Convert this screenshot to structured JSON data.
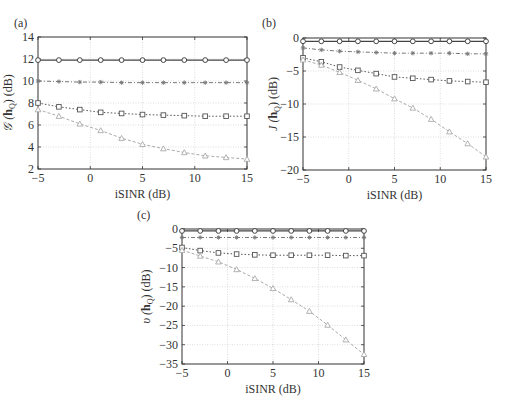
{
  "chart_data": [
    {
      "panel": "(a)",
      "type": "line",
      "title": "",
      "xlabel": "iSINR (dB)",
      "ylabel": "G(h_Q) (dB)",
      "ylabel_parts": {
        "func": "𝒢",
        "arg": "h",
        "sub": "Q",
        "unit": " (dB)"
      },
      "xlim": [
        -5,
        15
      ],
      "ylim": [
        2,
        14
      ],
      "xticks": [
        -5,
        0,
        5,
        10,
        15
      ],
      "yticks": [
        2,
        4,
        6,
        8,
        10,
        12,
        14
      ],
      "grid": true,
      "legend": null,
      "x": [
        -5,
        -3,
        -1,
        1,
        3,
        5,
        7,
        9,
        11,
        13,
        15
      ],
      "series": [
        {
          "name": "circle",
          "marker": "circle",
          "line": "solid",
          "color": "#444444",
          "values": [
            11.9,
            11.9,
            11.9,
            11.9,
            11.9,
            11.9,
            11.9,
            11.9,
            11.9,
            11.9,
            11.9
          ]
        },
        {
          "name": "star",
          "marker": "star",
          "line": "dashdot",
          "color": "#777777",
          "values": [
            10.0,
            9.95,
            9.9,
            9.9,
            9.85,
            9.85,
            9.85,
            9.85,
            9.85,
            9.85,
            9.85
          ]
        },
        {
          "name": "square",
          "marker": "square",
          "line": "dotted",
          "color": "#555555",
          "values": [
            8.0,
            7.65,
            7.4,
            7.15,
            7.05,
            6.95,
            6.9,
            6.85,
            6.8,
            6.8,
            6.8
          ]
        },
        {
          "name": "triangle",
          "marker": "triangle",
          "line": "dashed",
          "color": "#aaaaaa",
          "values": [
            7.4,
            6.8,
            6.1,
            5.5,
            4.8,
            4.25,
            3.85,
            3.5,
            3.2,
            3.05,
            2.9
          ]
        }
      ]
    },
    {
      "panel": "(b)",
      "type": "line",
      "title": "",
      "xlabel": "iSINR (dB)",
      "ylabel": "J(h_Q) (dB)",
      "ylabel_parts": {
        "func": "J",
        "arg": "h",
        "sub": "Q",
        "unit": " (dB)"
      },
      "xlim": [
        -5,
        15
      ],
      "ylim": [
        -20,
        0
      ],
      "xticks": [
        -5,
        0,
        5,
        10,
        15
      ],
      "yticks": [
        -20,
        -15,
        -10,
        -5,
        0
      ],
      "grid": true,
      "legend": null,
      "x": [
        -5,
        -3,
        -1,
        1,
        3,
        5,
        7,
        9,
        11,
        13,
        15
      ],
      "series": [
        {
          "name": "circle",
          "marker": "circle",
          "line": "solid",
          "color": "#444444",
          "values": [
            -0.5,
            -0.5,
            -0.5,
            -0.5,
            -0.5,
            -0.5,
            -0.5,
            -0.5,
            -0.5,
            -0.5,
            -0.5
          ]
        },
        {
          "name": "star",
          "marker": "star",
          "line": "dashdot",
          "color": "#777777",
          "values": [
            -1.5,
            -1.8,
            -2.0,
            -2.1,
            -2.2,
            -2.3,
            -2.3,
            -2.3,
            -2.3,
            -2.4,
            -2.4
          ]
        },
        {
          "name": "square",
          "marker": "square",
          "line": "dotted",
          "color": "#555555",
          "values": [
            -3.0,
            -3.6,
            -4.4,
            -4.9,
            -5.4,
            -5.9,
            -6.1,
            -6.3,
            -6.5,
            -6.6,
            -6.7
          ]
        },
        {
          "name": "triangle",
          "marker": "triangle",
          "line": "dashed",
          "color": "#aaaaaa",
          "values": [
            -3.3,
            -4.1,
            -5.2,
            -6.4,
            -7.7,
            -9.2,
            -10.6,
            -12.3,
            -14.2,
            -16.0,
            -18.0
          ]
        }
      ]
    },
    {
      "panel": "(c)",
      "type": "line",
      "title": "",
      "xlabel": "iSINR (dB)",
      "ylabel": "υ(h_Q) (dB)",
      "ylabel_parts": {
        "func": "υ",
        "arg": "h",
        "sub": "Q",
        "unit": " (dB)"
      },
      "xlim": [
        -5,
        15
      ],
      "ylim": [
        -35,
        0
      ],
      "xticks": [
        -5,
        0,
        5,
        10,
        15
      ],
      "yticks": [
        -35,
        -30,
        -25,
        -20,
        -15,
        -10,
        -5,
        0
      ],
      "grid": true,
      "legend": null,
      "x": [
        -5,
        -3,
        -1,
        1,
        3,
        5,
        7,
        9,
        11,
        13,
        15
      ],
      "series": [
        {
          "name": "circle",
          "marker": "circle",
          "line": "solid",
          "color": "#444444",
          "values": [
            -0.5,
            -0.5,
            -0.5,
            -0.5,
            -0.5,
            -0.5,
            -0.5,
            -0.5,
            -0.5,
            -0.5,
            -0.5
          ]
        },
        {
          "name": "star",
          "marker": "star",
          "line": "dashdot",
          "color": "#777777",
          "values": [
            -2.2,
            -2.2,
            -2.2,
            -2.2,
            -2.2,
            -2.2,
            -2.2,
            -2.2,
            -2.2,
            -2.2,
            -2.2
          ]
        },
        {
          "name": "square",
          "marker": "square",
          "line": "dotted",
          "color": "#555555",
          "values": [
            -4.8,
            -5.6,
            -6.2,
            -6.5,
            -6.7,
            -6.8,
            -6.8,
            -6.8,
            -6.8,
            -6.9,
            -6.9
          ]
        },
        {
          "name": "triangle",
          "marker": "triangle",
          "line": "dashed",
          "color": "#aaaaaa",
          "values": [
            -5.5,
            -7.0,
            -8.5,
            -10.5,
            -12.8,
            -15.4,
            -18.3,
            -21.3,
            -24.9,
            -28.7,
            -32.5
          ]
        }
      ]
    }
  ],
  "layout": [
    {
      "left": 38,
      "top": 37,
      "right": 247,
      "bottom": 169,
      "label_x": 14,
      "label_y": 27
    },
    {
      "left": 303,
      "top": 38,
      "right": 486,
      "bottom": 170,
      "label_x": 262,
      "label_y": 27
    },
    {
      "left": 182,
      "top": 229,
      "right": 364,
      "bottom": 364,
      "label_x": 137,
      "label_y": 219
    }
  ]
}
